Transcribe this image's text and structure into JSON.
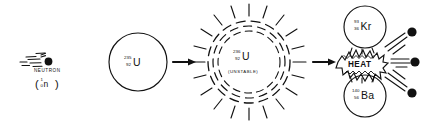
{
  "diagram": {
    "background_color": "#ffffff",
    "ink_color": "#111111"
  },
  "stages": {
    "incoming_neutron": {
      "caption": "NEUTRON",
      "notation_open_paren": "(",
      "notation_mass": "1",
      "notation_atomic": "0",
      "notation_symbol": "n",
      "notation_close_paren": ")"
    },
    "target_nucleus": {
      "mass_number": "235",
      "atomic_number": "92",
      "symbol": "U"
    },
    "unstable_nucleus": {
      "mass_number": "236",
      "atomic_number": "92",
      "symbol": "U",
      "state_label": "(UNSTABLE)"
    },
    "products": {
      "krypton": {
        "mass_number": "93",
        "atomic_number": "36",
        "symbol": "Kr"
      },
      "barium": {
        "mass_number": "140",
        "atomic_number": "56",
        "symbol": "Ba"
      },
      "energy_label": "HEAT",
      "released_neutron_count": "3"
    }
  }
}
